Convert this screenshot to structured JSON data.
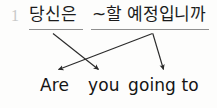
{
  "exercise": {
    "number": "1",
    "source": {
      "language": "Korean",
      "chunks": [
        {
          "id": "ko-subject",
          "text": "당신은"
        },
        {
          "id": "ko-predicate",
          "text": "~할 예정입니까"
        }
      ],
      "full_text": "당신은 ~할 예정입니까"
    },
    "target": {
      "language": "English",
      "chunks": [
        {
          "id": "en-are",
          "text": "Are"
        },
        {
          "id": "en-you",
          "text": "you"
        },
        {
          "id": "en-going-to",
          "text": "going to"
        }
      ],
      "full_text": "Are you going to"
    },
    "mappings": [
      {
        "from": "ko-subject",
        "to": "en-you"
      },
      {
        "from": "ko-predicate",
        "to": "en-are"
      },
      {
        "from": "ko-predicate",
        "to": "en-going-to"
      }
    ]
  },
  "style": {
    "background": "#fdfdfc",
    "ink": "#1b1b1b",
    "rule": "#8f8f8f",
    "number": "#c9c9c9",
    "arrow": "#2a2a2a"
  }
}
